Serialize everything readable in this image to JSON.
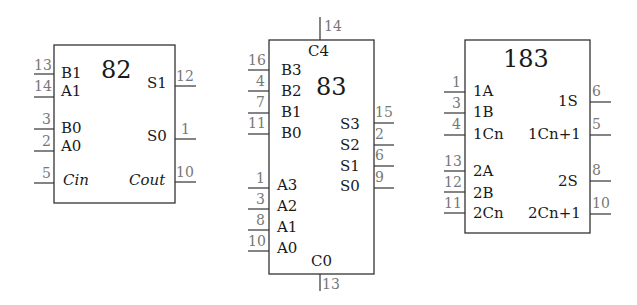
{
  "chips": [
    {
      "id": "82",
      "title": "82",
      "left_pins": [
        {
          "num": "13",
          "signal": "B1"
        },
        {
          "num": "14",
          "signal": "A1"
        },
        {
          "num": "3",
          "signal": "B0"
        },
        {
          "num": "2",
          "signal": "A0"
        },
        {
          "num": "5",
          "signal": "Cin"
        }
      ],
      "right_pins": [
        {
          "num": "12",
          "signal": "S1"
        },
        {
          "num": "1",
          "signal": "S0"
        },
        {
          "num": "10",
          "signal": "Cout"
        }
      ]
    },
    {
      "id": "83",
      "title": "83",
      "top_pin": {
        "num": "14",
        "signal": "C4"
      },
      "bottom_pin": {
        "num": "13",
        "signal": "C0"
      },
      "left_pins": [
        {
          "num": "16",
          "signal": "B3"
        },
        {
          "num": "4",
          "signal": "B2"
        },
        {
          "num": "7",
          "signal": "B1"
        },
        {
          "num": "11",
          "signal": "B0"
        },
        {
          "num": "1",
          "signal": "A3"
        },
        {
          "num": "3",
          "signal": "A2"
        },
        {
          "num": "8",
          "signal": "A1"
        },
        {
          "num": "10",
          "signal": "A0"
        }
      ],
      "right_pins": [
        {
          "num": "15",
          "signal": "S3"
        },
        {
          "num": "2",
          "signal": "S2"
        },
        {
          "num": "6",
          "signal": "S1"
        },
        {
          "num": "9",
          "signal": "S0"
        }
      ]
    },
    {
      "id": "183",
      "title": "183",
      "left_pins": [
        {
          "num": "1",
          "signal": "1A"
        },
        {
          "num": "3",
          "signal": "1B"
        },
        {
          "num": "4",
          "signal": "1Cn"
        },
        {
          "num": "13",
          "signal": "2A"
        },
        {
          "num": "12",
          "signal": "2B"
        },
        {
          "num": "11",
          "signal": "2Cn"
        }
      ],
      "right_pins": [
        {
          "num": "6",
          "signal": "1S"
        },
        {
          "num": "5",
          "signal": "1Cn+1"
        },
        {
          "num": "8",
          "signal": "2S"
        },
        {
          "num": "10",
          "signal": "2Cn+1"
        }
      ]
    }
  ]
}
